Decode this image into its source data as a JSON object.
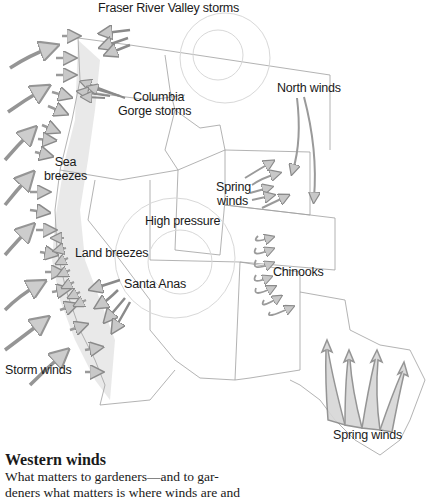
{
  "map": {
    "subject": "Western United States wind patterns",
    "labels": {
      "fraser": "Fraser River Valley storms",
      "columbia_1": "Columbia",
      "columbia_2": "Gorge storms",
      "north_winds": "North winds",
      "sea_1": "Sea",
      "sea_2": "breezes",
      "spring_1": "Spring",
      "spring_2": "winds",
      "high_pressure": "High pressure",
      "land_breezes": "Land breezes",
      "chinooks": "Chinooks",
      "santa_anas": "Santa Anas",
      "storm_winds": "Storm winds",
      "spring_winds_tx": "Spring winds"
    },
    "colors": {
      "arrow_fill": "#c8c8c8",
      "arrow_stroke": "#8a8a8a",
      "border": "#9a9a9a",
      "shade": "#e6e6e6"
    }
  },
  "caption": {
    "title": "Western winds",
    "body_line1": "What matters to gardeners—and to gar-",
    "body_line2": "deners what matters is where winds are and"
  }
}
